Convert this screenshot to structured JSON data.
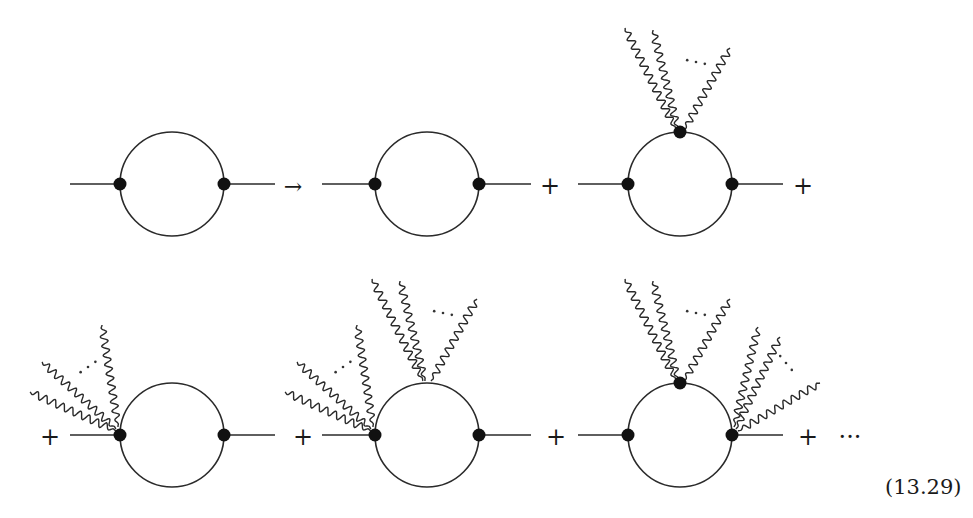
{
  "equation_label": "(13.29)",
  "colors": {
    "ink": "#2a2a2a",
    "vertex": "#111111",
    "background": "#ffffff"
  },
  "symbols": {
    "arrow": "→",
    "plus": "+",
    "ellipsis": "···",
    "dots": "· · ·"
  },
  "diagram": {
    "rows": [
      {
        "items": [
          {
            "id": "lhs-bubble",
            "center": [
              172,
              184
            ],
            "radius": 52,
            "line": [
              70,
              275
            ],
            "vertices": [
              "left",
              "right"
            ],
            "photons": []
          },
          {
            "operator": "arrow",
            "pos": [
              293,
              190
            ]
          },
          {
            "id": "bare-bubble",
            "center": [
              427,
              184
            ],
            "radius": 52,
            "line": [
              322,
              531
            ],
            "vertices": [
              "left",
              "right"
            ],
            "photons": []
          },
          {
            "operator": "plus",
            "pos": [
              550,
              190
            ]
          },
          {
            "id": "top-vertex-bubble",
            "center": [
              680,
              184
            ],
            "radius": 52,
            "line": [
              578,
              783
            ],
            "vertices": [
              "left",
              "right",
              "top"
            ],
            "photons": [
              {
                "vertex": "top",
                "count": "n",
                "dots": true
              }
            ]
          },
          {
            "operator": "plus",
            "pos": [
              803,
              190
            ]
          }
        ]
      },
      {
        "items": [
          {
            "operator": "plus",
            "pos": [
              50,
              441
            ]
          },
          {
            "id": "left-vertex-bubble",
            "center": [
              172,
              435
            ],
            "radius": 52,
            "line": [
              70,
              275
            ],
            "vertices": [
              "left",
              "right"
            ],
            "photons": [
              {
                "vertex": "left",
                "count": "n",
                "dots": true
              }
            ]
          },
          {
            "operator": "plus",
            "pos": [
              303,
              441
            ]
          },
          {
            "id": "left-top-bubble",
            "center": [
              427,
              435
            ],
            "radius": 52,
            "line": [
              322,
              531
            ],
            "vertices": [
              "left",
              "right"
            ],
            "photons": [
              {
                "vertex": "left",
                "count": "n",
                "dots": true
              },
              {
                "vertex": "top",
                "count": "m",
                "dots": true
              }
            ]
          },
          {
            "operator": "plus",
            "pos": [
              556,
              441
            ]
          },
          {
            "id": "top-right-bubble",
            "center": [
              680,
              435
            ],
            "radius": 52,
            "line": [
              578,
              783
            ],
            "vertices": [
              "left",
              "right",
              "top"
            ],
            "photons": [
              {
                "vertex": "top",
                "count": "n",
                "dots": true
              },
              {
                "vertex": "right",
                "count": "m",
                "dots": true
              }
            ]
          },
          {
            "operator": "plus",
            "pos": [
              808,
              441
            ]
          },
          {
            "operator": "ellipsis",
            "pos": [
              850,
              441
            ]
          }
        ]
      }
    ]
  }
}
